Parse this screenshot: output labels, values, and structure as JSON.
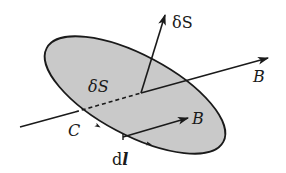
{
  "diagram": {
    "colors": {
      "surface_fill": "#c9c9c9",
      "stroke": "#1a1a1a",
      "background": "#ffffff"
    },
    "labels": {
      "normal_vector": "δS",
      "surface": "δS",
      "field_outer": "B",
      "field_inner": "B",
      "curve": "C",
      "line_element_d": "d",
      "line_element_l": "l"
    }
  }
}
